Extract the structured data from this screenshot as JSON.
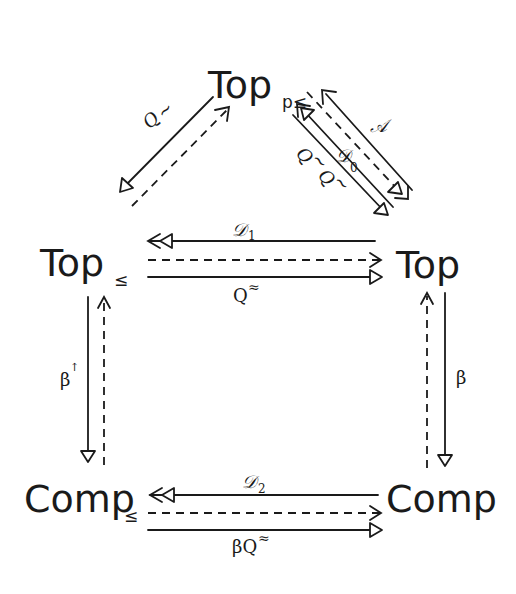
{
  "diagram": {
    "nodes": {
      "top_pleq": {
        "base": "Top",
        "subscript": "p≤"
      },
      "top_leq": {
        "base": "Top",
        "subscript": "≤"
      },
      "top": {
        "base": "Top",
        "subscript": ""
      },
      "comp_leq": {
        "base": "Comp",
        "subscript": "≤"
      },
      "comp": {
        "base": "Comp",
        "subscript": ""
      }
    },
    "arrows": [
      {
        "id": "q-tilde-left",
        "from": "Top_p≤",
        "to": "Top_≤",
        "label": "Q~",
        "style": "solid",
        "head": "triangle"
      },
      {
        "id": "inclusion-left",
        "from": "Top_≤",
        "to": "Top_p≤",
        "label": "",
        "style": "dashed",
        "head": "open"
      },
      {
        "id": "A",
        "from": "Top",
        "to": "Top_p≤",
        "label": "𝒜",
        "style": "solid",
        "head": "open"
      },
      {
        "id": "D0",
        "from": "Top",
        "to": "Top_p≤",
        "label": "𝒟₀",
        "style": "solid",
        "head": "double-triangle"
      },
      {
        "id": "inclusion-right",
        "from": "Top_p≤",
        "to": "Top",
        "label": "",
        "style": "dashed",
        "head": "triangle-open"
      },
      {
        "id": "q-tilde-right",
        "from": "Top_p≤",
        "to": "Top",
        "label": "Q~ Q~",
        "style": "solid",
        "head": "triangle"
      },
      {
        "id": "D1",
        "from": "Top",
        "to": "Top_≤",
        "label": "𝒟₁",
        "style": "solid",
        "head": "double-triangle"
      },
      {
        "id": "inclusion-mid",
        "from": "Top_≤",
        "to": "Top",
        "label": "",
        "style": "dashed",
        "head": "open"
      },
      {
        "id": "Q-approx",
        "from": "Top_≤",
        "to": "Top",
        "label": "Q≈",
        "style": "solid",
        "head": "triangle"
      },
      {
        "id": "beta-up",
        "from": "Top_≤",
        "to": "Comp_≤",
        "label": "β↑",
        "style": "solid",
        "head": "triangle"
      },
      {
        "id": "inclusion-left-vert",
        "from": "Comp_≤",
        "to": "Top_≤",
        "label": "",
        "style": "dashed",
        "head": "open"
      },
      {
        "id": "beta",
        "from": "Top",
        "to": "Comp",
        "label": "β",
        "style": "solid",
        "head": "triangle"
      },
      {
        "id": "inclusion-right-vert",
        "from": "Comp",
        "to": "Top",
        "label": "",
        "style": "dashed",
        "head": "open"
      },
      {
        "id": "D2",
        "from": "Comp",
        "to": "Comp_≤",
        "label": "𝒟₂",
        "style": "solid",
        "head": "double-triangle"
      },
      {
        "id": "inclusion-bottom",
        "from": "Comp_≤",
        "to": "Comp",
        "label": "",
        "style": "dashed",
        "head": "open"
      },
      {
        "id": "beta-Q-approx",
        "from": "Comp_≤",
        "to": "Comp",
        "label": "βQ≈",
        "style": "solid",
        "head": "triangle"
      }
    ],
    "labels": {
      "q_tilde": "Q",
      "tilde": "~",
      "A": "𝒜",
      "D0": "𝒟",
      "D0_sub": "0",
      "Q_tilde_1": "Q",
      "Q_tilde_2": "Q",
      "D1": "𝒟",
      "D1_sub": "1",
      "Q_approx": "Q",
      "approx": "≈",
      "beta_up": "β",
      "up_arrow": "↑",
      "beta": "β",
      "D2": "𝒟",
      "D2_sub": "2",
      "beta_Q_approx": "βQ"
    }
  }
}
